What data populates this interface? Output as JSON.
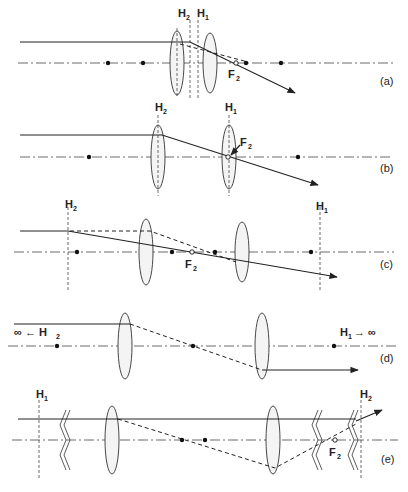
{
  "figure": {
    "panels": [
      {
        "id": "a",
        "caption": "(a)",
        "labels": {
          "h2": "H",
          "h2_sub": "2",
          "h1": "H",
          "h1_sub": "1",
          "f2": "F",
          "f2_sub": "2"
        }
      },
      {
        "id": "b",
        "caption": "(b)",
        "labels": {
          "h2": "H",
          "h2_sub": "2",
          "h1": "H",
          "h1_sub": "1",
          "f2": "F",
          "f2_sub": "2"
        }
      },
      {
        "id": "c",
        "caption": "(c)",
        "labels": {
          "h2": "H",
          "h2_sub": "2",
          "h1": "H",
          "h1_sub": "1",
          "f2": "F",
          "f2_sub": "2"
        }
      },
      {
        "id": "d",
        "caption": "(d)",
        "labels": {
          "h2_left": "∞ ← H",
          "h2_sub": "2",
          "h1_right": "H",
          "h1_sub": "1",
          "h1_arrow": "→ ∞"
        }
      },
      {
        "id": "e",
        "caption": "(e)",
        "labels": {
          "h1": "H",
          "h1_sub": "1",
          "h2": "H",
          "h2_sub": "2",
          "f2": "F",
          "f2_sub": "2"
        }
      }
    ]
  }
}
